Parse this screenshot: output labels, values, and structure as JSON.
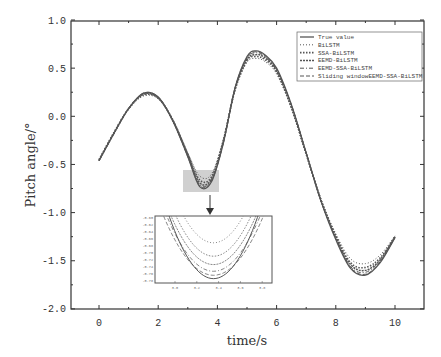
{
  "chart_data": {
    "type": "line",
    "title": "",
    "xlabel": "time/s",
    "ylabel": "Pitch angle/°",
    "xlim": [
      -1.0,
      11.0
    ],
    "ylim": [
      -2.0,
      1.0
    ],
    "xticks": [
      0,
      2,
      4,
      6,
      8,
      10
    ],
    "xtick_labels": [
      "0",
      "2",
      "4",
      "6",
      "8",
      "10"
    ],
    "yticks": [
      1.0,
      0.5,
      0.0,
      -0.5,
      -1.0,
      -1.5,
      -2.0
    ],
    "ytick_labels": [
      "1.0",
      "0.5",
      "0.0",
      "-0.5",
      "-1.0",
      "-1.5",
      "-2.0"
    ],
    "grid": false,
    "legend_position": "upper right",
    "x": [
      0,
      0.5,
      1.0,
      1.5,
      2.0,
      2.5,
      3.0,
      3.4,
      3.8,
      4.2,
      4.6,
      5.0,
      5.3,
      5.6,
      6.0,
      6.5,
      7.0,
      7.5,
      8.0,
      8.5,
      9.0,
      9.5,
      10.0
    ],
    "series": [
      {
        "name": "True value",
        "style": "solid",
        "values": [
          -0.46,
          -0.18,
          0.08,
          0.24,
          0.2,
          -0.05,
          -0.42,
          -0.73,
          -0.68,
          -0.28,
          0.3,
          0.62,
          0.68,
          0.64,
          0.5,
          0.12,
          -0.38,
          -0.88,
          -1.28,
          -1.58,
          -1.65,
          -1.52,
          -1.26
        ]
      },
      {
        "name": "BiLSTM",
        "style": "dotted",
        "values": [
          -0.45,
          -0.17,
          0.07,
          0.21,
          0.18,
          -0.04,
          -0.38,
          -0.62,
          -0.6,
          -0.24,
          0.27,
          0.56,
          0.6,
          0.57,
          0.44,
          0.08,
          -0.4,
          -0.86,
          -1.22,
          -1.48,
          -1.53,
          -1.44,
          -1.24
        ]
      },
      {
        "name": "SSA-BiLSTM",
        "style": "star",
        "values": [
          -0.45,
          -0.17,
          0.08,
          0.22,
          0.19,
          -0.04,
          -0.39,
          -0.66,
          -0.63,
          -0.25,
          0.28,
          0.58,
          0.62,
          0.59,
          0.46,
          0.09,
          -0.39,
          -0.87,
          -1.24,
          -1.52,
          -1.57,
          -1.47,
          -1.25
        ]
      },
      {
        "name": "EEMD-BiLSTM",
        "style": "plus",
        "values": [
          -0.46,
          -0.18,
          0.08,
          0.23,
          0.19,
          -0.05,
          -0.4,
          -0.69,
          -0.65,
          -0.26,
          0.29,
          0.59,
          0.64,
          0.61,
          0.47,
          0.1,
          -0.39,
          -0.87,
          -1.25,
          -1.54,
          -1.6,
          -1.49,
          -1.25
        ]
      },
      {
        "name": "EEMD-SSA-BiLSTM",
        "style": "dashdot",
        "values": [
          -0.46,
          -0.18,
          0.08,
          0.23,
          0.2,
          -0.05,
          -0.41,
          -0.71,
          -0.66,
          -0.27,
          0.29,
          0.6,
          0.66,
          0.62,
          0.48,
          0.11,
          -0.38,
          -0.88,
          -1.26,
          -1.56,
          -1.62,
          -1.5,
          -1.26
        ]
      },
      {
        "name": "Sliding windowEEMD-SSA-BiLSTM",
        "style": "dashed",
        "values": [
          -0.46,
          -0.18,
          0.08,
          0.24,
          0.2,
          -0.05,
          -0.42,
          -0.72,
          -0.67,
          -0.28,
          0.3,
          0.61,
          0.67,
          0.63,
          0.49,
          0.12,
          -0.38,
          -0.88,
          -1.27,
          -1.57,
          -1.64,
          -1.51,
          -1.26
        ]
      }
    ],
    "annotations": [
      {
        "type": "zoom-box",
        "x_range": [
          2.85,
          4.05
        ],
        "y_range": [
          -0.81,
          -0.58
        ],
        "label": "magnified region"
      }
    ],
    "inset": {
      "xlim": [
        2.8,
        4.0
      ],
      "ylim": [
        -0.78,
        -0.58
      ],
      "xtick_labels": [
        "3.0",
        "3.2",
        "3.4",
        "3.6",
        "3.8"
      ],
      "ytick_labels": [
        "-0.60",
        "-0.62",
        "-0.64",
        "-0.66",
        "-0.68",
        "-0.70",
        "-0.72",
        "-0.74",
        "-0.76",
        "-0.78"
      ]
    }
  },
  "legend": {
    "items": [
      {
        "label": "True value"
      },
      {
        "label": "BiLSTM"
      },
      {
        "label": "SSA-BiLSTM"
      },
      {
        "label": "EEMD-BiLSTM"
      },
      {
        "label": "EEMD-SSA-BiLSTM"
      },
      {
        "label": "Sliding windowEEMD-SSA-BiLSTM"
      }
    ]
  },
  "colors": {
    "line": "#555555",
    "axis": "#333333",
    "zoom_box": "#c8c8c8"
  }
}
